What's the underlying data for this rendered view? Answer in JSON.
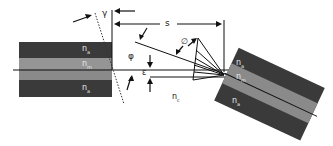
{
  "diagram": {
    "type": "fiber-misalignment-schematic",
    "labels": {
      "gamma": "γ",
      "s": "s",
      "phi": "φ",
      "theta": "∅",
      "epsilon": "ε",
      "n_gap": "n",
      "n_gap_sub": "c"
    },
    "left_fiber": {
      "cladding_top": {
        "n": "n",
        "sub": "a"
      },
      "core": {
        "n": "n",
        "sub": "m"
      },
      "cladding_bottom": {
        "n": "n",
        "sub": "a"
      }
    },
    "right_fiber": {
      "cladding_top": {
        "n": "n",
        "sub": "a"
      },
      "core": {
        "n": "n",
        "sub": "m"
      },
      "cladding_bottom": {
        "n": "n",
        "sub": "a"
      }
    },
    "colors": {
      "cladding": "#3a3a3a",
      "core": "#8a8a8a",
      "line": "#111111"
    }
  }
}
